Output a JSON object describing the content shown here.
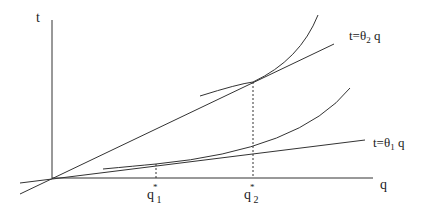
{
  "axes": {
    "y_label": "t",
    "x_label": "q"
  },
  "lines": [
    {
      "name": "theta2-line",
      "label_prefix": "t=θ",
      "label_sub": "2",
      "label_suffix": " q"
    },
    {
      "name": "theta1-line",
      "label_prefix": "t=θ",
      "label_sub": "1",
      "label_suffix": " q"
    }
  ],
  "ticks": [
    {
      "name": "q1-star",
      "base": "q",
      "sup": "*",
      "sub": "1"
    },
    {
      "name": "q2-star",
      "base": "q",
      "sup": "*",
      "sub": "2"
    }
  ],
  "colors": {
    "stroke": "#333333",
    "background": "#ffffff"
  }
}
